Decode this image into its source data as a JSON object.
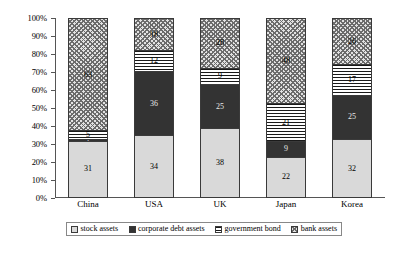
{
  "chart_data": {
    "type": "bar",
    "subtype": "stacked-100-percent",
    "title": "",
    "xlabel": "",
    "ylabel": "",
    "ylim": [
      0,
      100
    ],
    "grid": false,
    "legend_position": "bottom",
    "categories": [
      "China",
      "USA",
      "UK",
      "Japan",
      "Korea"
    ],
    "y_tick_labels": [
      "0%",
      "10%",
      "20%",
      "30%",
      "40%",
      "50%",
      "60%",
      "70%",
      "80%",
      "90%",
      "100%"
    ],
    "y_tick_values": [
      0,
      10,
      20,
      30,
      40,
      50,
      60,
      70,
      80,
      90,
      100
    ],
    "series": [
      {
        "name": "stock assets",
        "pattern": "light-gray-solid",
        "color": "#d9d9d9",
        "values": [
          31,
          34,
          38,
          22,
          32
        ]
      },
      {
        "name": "corporate debt assets",
        "pattern": "dark-solid",
        "color": "#333333",
        "values": [
          1,
          36,
          25,
          9,
          25
        ]
      },
      {
        "name": "government bond",
        "pattern": "horizontal-lines",
        "color": "#1a1a1a",
        "values": [
          5,
          12,
          9,
          21,
          17
        ]
      },
      {
        "name": "bank assets",
        "pattern": "cross-hatch",
        "color": "#6b6b6b",
        "values": [
          63,
          18,
          28,
          48,
          26
        ]
      }
    ]
  },
  "legend": {
    "items": [
      {
        "label": "stock assets"
      },
      {
        "label": "corporate debt assets"
      },
      {
        "label": "government bond"
      },
      {
        "label": "bank assets"
      }
    ]
  }
}
